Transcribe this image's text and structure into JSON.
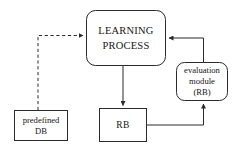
{
  "diagram": {
    "type": "flowchart",
    "background_color": "#ffffff",
    "stroke_color": "#2b2b2b",
    "nodes": [
      {
        "id": "learning-process",
        "label_lines": [
          "LEARNING",
          "PROCESS"
        ],
        "line1": "LEARNING",
        "line2": "PROCESS",
        "shape": "rounded-rectangle",
        "x": 86,
        "y": 10,
        "width": 80,
        "height": 56
      },
      {
        "id": "evaluation-module",
        "label_lines": [
          "evaluation",
          "module",
          "(RB)"
        ],
        "line1": "evaluation",
        "line2": "module",
        "line3": "(RB)",
        "shape": "rounded-rectangle",
        "x": 176,
        "y": 62,
        "width": 52,
        "height": 39
      },
      {
        "id": "predefined-db",
        "label_lines": [
          "predefined",
          "DB"
        ],
        "line1": "predefined",
        "line2": "DB",
        "shape": "rectangle",
        "x": 14,
        "y": 110,
        "width": 54,
        "height": 31
      },
      {
        "id": "rb",
        "label_lines": [
          "RB"
        ],
        "line1": "RB",
        "shape": "rectangle",
        "x": 99,
        "y": 108,
        "width": 48,
        "height": 34
      }
    ],
    "edges": [
      {
        "id": "predefined-db-to-learning-process",
        "from": "predefined-db",
        "to": "learning-process",
        "style": "dashed",
        "arrow": true,
        "path": "vertical-then-horizontal"
      },
      {
        "id": "learning-process-to-rb",
        "from": "learning-process",
        "to": "rb",
        "style": "solid",
        "arrow": true,
        "path": "vertical"
      },
      {
        "id": "rb-to-evaluation-module",
        "from": "rb",
        "to": "evaluation-module",
        "style": "solid",
        "arrow": true,
        "path": "horizontal-then-vertical"
      },
      {
        "id": "evaluation-module-to-learning-process",
        "from": "evaluation-module",
        "to": "learning-process",
        "style": "solid",
        "arrow": true,
        "path": "vertical-then-horizontal"
      }
    ]
  }
}
